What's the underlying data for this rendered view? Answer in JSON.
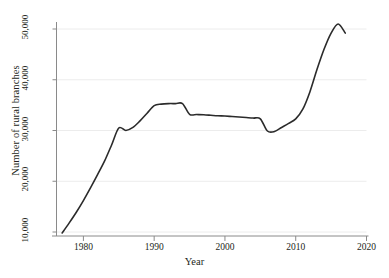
{
  "chart_data": {
    "type": "line",
    "title": "",
    "xlabel": "Year",
    "ylabel": "Number of rural branches",
    "xlim": [
      1976.2,
      2020
    ],
    "ylim": [
      8200,
      52600
    ],
    "xticks": [
      1980,
      1990,
      2000,
      2010,
      2020
    ],
    "xtick_labels": [
      "1980",
      "1990",
      "2000",
      "2010",
      "2020"
    ],
    "yticks": [
      10000,
      20000,
      30000,
      40000,
      50000
    ],
    "ytick_labels": [
      "10,000",
      "20,000",
      "30,000",
      "40,000",
      "50,000"
    ],
    "grid": "horizontal",
    "legend": "none",
    "line_color": "#2b2b2b",
    "grid_color": "#ececec",
    "axis_color": "#8a8a8a",
    "background": "#ffffff",
    "x": [
      1977,
      1978,
      1979,
      1980,
      1981,
      1982,
      1983,
      1984,
      1985,
      1986,
      1987,
      1988,
      1989,
      1990,
      1991,
      1992,
      1993,
      1994,
      1995,
      1996,
      1997,
      1998,
      1999,
      2000,
      2001,
      2002,
      2003,
      2004,
      2005,
      2006,
      2007,
      2008,
      2009,
      2010,
      2011,
      2012,
      2013,
      2014,
      2015,
      2016,
      2017
    ],
    "values": [
      9800,
      11800,
      13900,
      16200,
      18700,
      21300,
      24000,
      27200,
      30500,
      30000,
      30600,
      31900,
      33400,
      34900,
      35200,
      35300,
      35300,
      35300,
      33200,
      33150,
      33100,
      33000,
      32900,
      32850,
      32750,
      32650,
      32550,
      32450,
      32300,
      29900,
      29800,
      30600,
      31400,
      32300,
      34200,
      37600,
      42000,
      46000,
      49200,
      51000,
      49200
    ],
    "series": [
      {
        "name": "Number of rural branches",
        "values": [
          9800,
          11800,
          13900,
          16200,
          18700,
          21300,
          24000,
          27200,
          30500,
          30000,
          30600,
          31900,
          33400,
          34900,
          35200,
          35300,
          35300,
          35300,
          33200,
          33150,
          33100,
          33000,
          32900,
          32850,
          32750,
          32650,
          32550,
          32450,
          32300,
          29900,
          29800,
          30600,
          31400,
          32300,
          34200,
          37600,
          42000,
          46000,
          49200,
          51000,
          49200
        ]
      }
    ]
  }
}
